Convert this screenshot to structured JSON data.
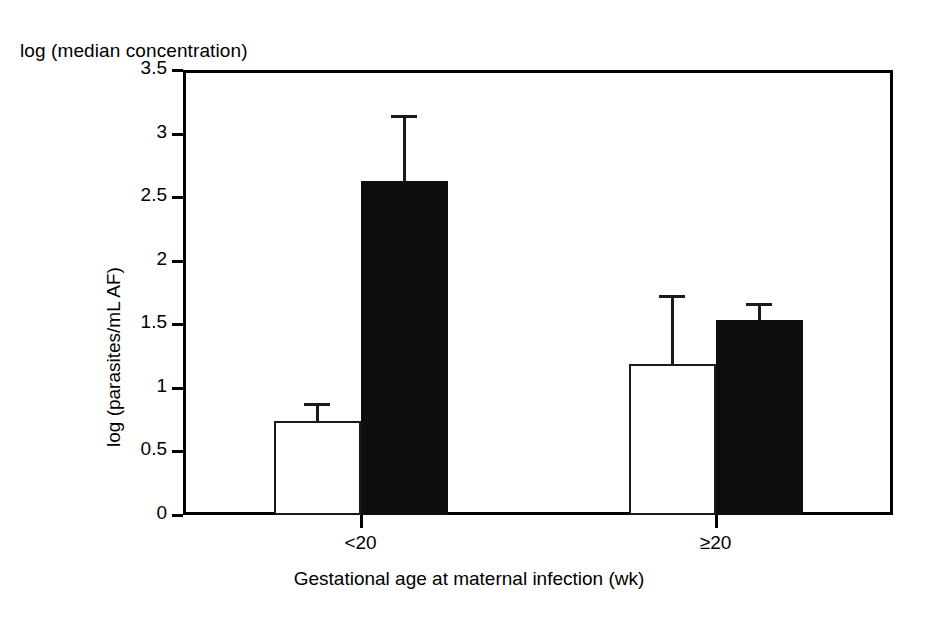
{
  "chart_data": {
    "type": "bar",
    "title": "log (median concentration)",
    "xlabel": "Gestational age at maternal infection (wk)",
    "ylabel": "log (parasites/mL AF)",
    "categories": [
      "<20",
      "≥20"
    ],
    "ylim": [
      0,
      3.5
    ],
    "yticks": [
      "0",
      "0.5",
      "1",
      "1.5",
      "2",
      "2.5",
      "3",
      "3.5"
    ],
    "ytick_values": [
      0,
      0.5,
      1,
      1.5,
      2,
      2.5,
      3,
      3.5
    ],
    "grid": false,
    "legend": "none",
    "series": [
      {
        "name": "open",
        "fill": "#ffffff",
        "values": [
          0.74,
          1.19
        ],
        "error_upper": [
          0.88,
          1.73
        ]
      },
      {
        "name": "filled",
        "fill": "#0d0d0d",
        "values": [
          2.63,
          1.53
        ],
        "error_upper": [
          3.15,
          1.67
        ]
      }
    ]
  },
  "colors": {
    "axis": "#000000",
    "open_bar": "#ffffff",
    "filled_bar": "#0d0d0d",
    "background": "#ffffff"
  }
}
